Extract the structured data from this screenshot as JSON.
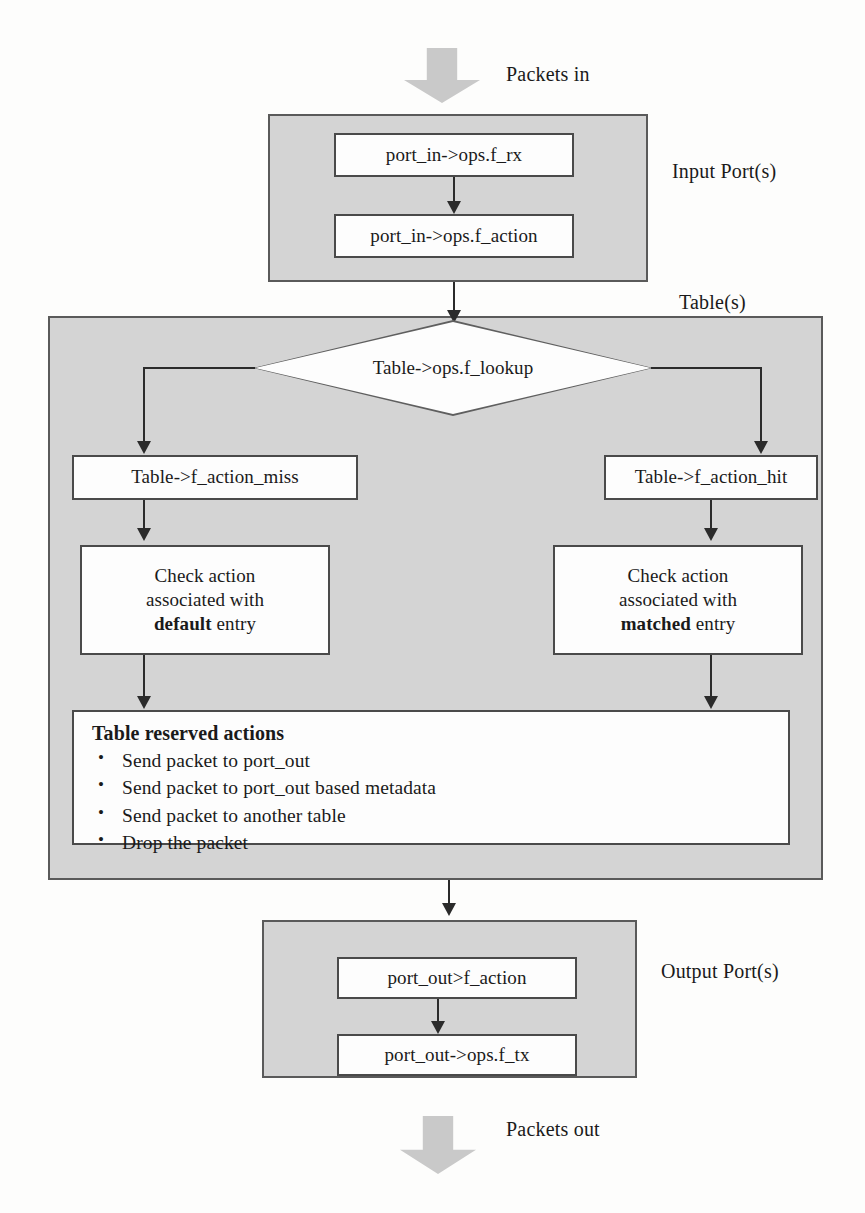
{
  "packets_in": {
    "label": "Packets in",
    "arrow_icon": "down-block-arrow-icon"
  },
  "packets_out": {
    "label": "Packets out",
    "arrow_icon": "down-block-arrow-icon"
  },
  "input_port": {
    "group_label": "Input Port(s)",
    "boxes": [
      {
        "text": "port_in->ops.f_rx"
      },
      {
        "text": "port_in->ops.f_action"
      }
    ]
  },
  "table": {
    "group_label": "Table(s)",
    "decision": {
      "text": "Table->ops.f_lookup"
    },
    "branches": [
      {
        "text": "Table->f_action_miss"
      },
      {
        "text": "Table->f_action_hit"
      }
    ],
    "checks": [
      {
        "line1": "Check action",
        "line2": "associated with",
        "emphasis": "default",
        "line3_suffix": " entry"
      },
      {
        "line1": "Check action",
        "line2": "associated with",
        "emphasis": "matched",
        "line3_suffix": " entry"
      }
    ],
    "reserved_actions": {
      "title": "Table reserved actions",
      "items": [
        "Send packet to port_out",
        "Send packet to port_out based metadata",
        "Send packet to another table",
        "Drop the packet"
      ]
    }
  },
  "output_port": {
    "group_label": "Output Port(s)",
    "boxes": [
      {
        "text": "port_out>f_action"
      },
      {
        "text": "port_out->ops.f_tx"
      }
    ]
  },
  "colors": {
    "page_background": "#fdfdfc",
    "group_fill": "#d4d4d4",
    "group_border": "#5a5a5a",
    "node_fill": "#fdfdfd",
    "node_border": "#4a4a4a",
    "connector": "#2b2b2b",
    "block_arrow_fill": "#c9c9c9",
    "text": "#1a1a1a"
  }
}
